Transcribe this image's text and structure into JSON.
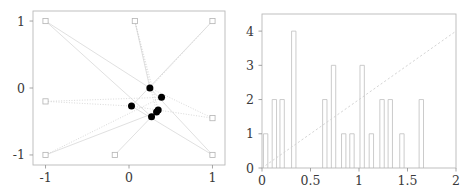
{
  "figure": {
    "panels": [
      "scatter-network-plot",
      "histogram-plot"
    ],
    "background_color": "#ffffff",
    "line_color": "#d8d8d8",
    "marker_fill_color": "#000000",
    "bar_stroke_color": "#c2c2c2"
  },
  "chart_data": [
    {
      "type": "scatter",
      "title": "",
      "xlabel": "",
      "ylabel": "",
      "xlim": [
        -1.15,
        1.15
      ],
      "ylim": [
        -1.15,
        1.15
      ],
      "grid": false,
      "legend": null,
      "xticks": [
        -1,
        0,
        1
      ],
      "xticklabels": [
        "-1",
        "0",
        "1"
      ],
      "yticks": [
        -1,
        0,
        1
      ],
      "yticklabels": [
        "-1",
        "0",
        "1"
      ],
      "series": [
        {
          "name": "boundary-squares",
          "marker": "open-square",
          "points": [
            {
              "x": -1.0,
              "y": 1.0
            },
            {
              "x": 0.07,
              "y": 1.0
            },
            {
              "x": 1.0,
              "y": 1.0
            },
            {
              "x": -1.0,
              "y": -0.2
            },
            {
              "x": 1.0,
              "y": -0.45
            },
            {
              "x": -1.0,
              "y": -1.0
            },
            {
              "x": -0.17,
              "y": -1.0
            },
            {
              "x": 1.0,
              "y": -1.0
            }
          ]
        },
        {
          "name": "interior-dots",
          "marker": "filled-circle",
          "points": [
            {
              "x": 0.25,
              "y": 0.0
            },
            {
              "x": 0.39,
              "y": -0.14
            },
            {
              "x": 0.03,
              "y": -0.27
            },
            {
              "x": 0.35,
              "y": -0.33
            },
            {
              "x": 0.33,
              "y": -0.36
            },
            {
              "x": 0.27,
              "y": -0.43
            }
          ]
        }
      ],
      "edges": [
        {
          "from": [
            -1.0,
            1.0
          ],
          "to": [
            0.25,
            0.0
          ],
          "style": "solid"
        },
        {
          "from": [
            -1.0,
            1.0
          ],
          "to": [
            0.27,
            -0.43
          ],
          "style": "solid"
        },
        {
          "from": [
            0.07,
            1.0
          ],
          "to": [
            0.25,
            0.0
          ],
          "style": "solid"
        },
        {
          "from": [
            0.07,
            1.0
          ],
          "to": [
            0.35,
            -0.33
          ],
          "style": "dotted"
        },
        {
          "from": [
            0.07,
            1.0
          ],
          "to": [
            0.33,
            -0.36
          ],
          "style": "dotted"
        },
        {
          "from": [
            1.0,
            1.0
          ],
          "to": [
            0.25,
            0.0
          ],
          "style": "dotted"
        },
        {
          "from": [
            1.0,
            1.0
          ],
          "to": [
            0.03,
            -0.27
          ],
          "style": "solid"
        },
        {
          "from": [
            -1.0,
            -0.2
          ],
          "to": [
            0.03,
            -0.27
          ],
          "style": "dotted"
        },
        {
          "from": [
            -1.0,
            -0.2
          ],
          "to": [
            0.39,
            -0.14
          ],
          "style": "dotted"
        },
        {
          "from": [
            1.0,
            -0.45
          ],
          "to": [
            0.03,
            -0.27
          ],
          "style": "dotted"
        },
        {
          "from": [
            1.0,
            -0.45
          ],
          "to": [
            0.25,
            0.0
          ],
          "style": "dotted"
        },
        {
          "from": [
            -1.0,
            -1.0
          ],
          "to": [
            0.33,
            -0.36
          ],
          "style": "solid"
        },
        {
          "from": [
            -1.0,
            -1.0
          ],
          "to": [
            0.39,
            -0.14
          ],
          "style": "dotted"
        },
        {
          "from": [
            -0.17,
            -1.0
          ],
          "to": [
            0.27,
            -0.43
          ],
          "style": "solid"
        },
        {
          "from": [
            1.0,
            -1.0
          ],
          "to": [
            0.25,
            0.0
          ],
          "style": "solid"
        },
        {
          "from": [
            1.0,
            -1.0
          ],
          "to": [
            0.03,
            -0.27
          ],
          "style": "solid"
        }
      ]
    },
    {
      "type": "bar",
      "subtype": "histogram",
      "title": "",
      "xlabel": "",
      "ylabel": "",
      "xlim": [
        0,
        2
      ],
      "ylim": [
        0,
        4.5
      ],
      "grid": false,
      "legend": null,
      "xticks": [
        0,
        0.5,
        1,
        1.5,
        2
      ],
      "xticklabels": [
        "0",
        "0.5",
        "1",
        "1.5",
        "2"
      ],
      "yticks": [
        0,
        1,
        2,
        3,
        4
      ],
      "yticklabels": [
        "0",
        "1",
        "2",
        "3",
        "4"
      ],
      "bin_width": 0.045,
      "bins": [
        {
          "x0": 0.015,
          "height": 1
        },
        {
          "x0": 0.105,
          "height": 2
        },
        {
          "x0": 0.185,
          "height": 2
        },
        {
          "x0": 0.305,
          "height": 4
        },
        {
          "x0": 0.625,
          "height": 2
        },
        {
          "x0": 0.715,
          "height": 3
        },
        {
          "x0": 0.82,
          "height": 1
        },
        {
          "x0": 0.905,
          "height": 1
        },
        {
          "x0": 1.01,
          "height": 3
        },
        {
          "x0": 1.105,
          "height": 1
        },
        {
          "x0": 1.215,
          "height": 2
        },
        {
          "x0": 1.3,
          "height": 2
        },
        {
          "x0": 1.42,
          "height": 1
        },
        {
          "x0": 1.62,
          "height": 2
        }
      ],
      "reference_line": {
        "name": "diagonal-reference-line",
        "style": "dashed",
        "from": [
          0,
          0
        ],
        "to": [
          2,
          4
        ]
      }
    }
  ]
}
